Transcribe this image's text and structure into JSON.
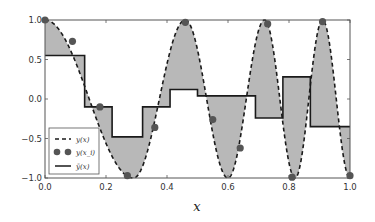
{
  "chart_data": {
    "type": "line",
    "title": "",
    "xlabel": "x",
    "ylabel": "",
    "xlim": [
      0.0,
      1.0
    ],
    "ylim": [
      -1.0,
      1.0
    ],
    "grid": false,
    "legend_position": "lower left",
    "xticks": [
      "0.0",
      "0.2",
      "0.4",
      "0.6",
      "0.8",
      "1.0"
    ],
    "yticks": [
      "1.0",
      "0.5",
      "0.0",
      "-0.5",
      "-1.0"
    ],
    "legend": [
      {
        "label": "y(x)",
        "style": "dashed"
      },
      {
        "label": "y(x_i)",
        "style": "markers"
      },
      {
        "label": "ȳ(x)",
        "style": "solid"
      }
    ],
    "series": [
      {
        "name": "y(x)",
        "style": "dashed",
        "description": "oscillating cosine-like curve with increasing frequency; fill between y(x) and ȳ(x) shaded gray",
        "peaks_x": [
          0.0,
          0.46,
          0.72,
          0.91
        ],
        "troughs_x": [
          0.29,
          0.6,
          0.82,
          1.0
        ]
      },
      {
        "name": "y(x_i)",
        "style": "markers",
        "x": [
          0.0,
          0.09,
          0.18,
          0.27,
          0.36,
          0.46,
          0.55,
          0.64,
          0.73,
          0.81,
          0.91,
          1.0
        ],
        "y": [
          1.0,
          0.73,
          -0.1,
          -0.97,
          -0.36,
          0.97,
          -0.26,
          -0.62,
          0.95,
          -0.99,
          0.98,
          -0.97
        ]
      },
      {
        "name": "ȳ(x)",
        "style": "step",
        "x_edges": [
          0.0,
          0.13,
          0.22,
          0.32,
          0.41,
          0.5,
          0.69,
          0.78,
          0.87,
          1.0
        ],
        "values": [
          0.55,
          -0.1,
          -0.48,
          -0.1,
          0.12,
          0.04,
          -0.24,
          0.28,
          -0.35
        ]
      }
    ]
  },
  "colors": {
    "fill": "#b8b8b8",
    "line": "#1a1a1a",
    "marker": "#555555",
    "axis": "#444444"
  }
}
